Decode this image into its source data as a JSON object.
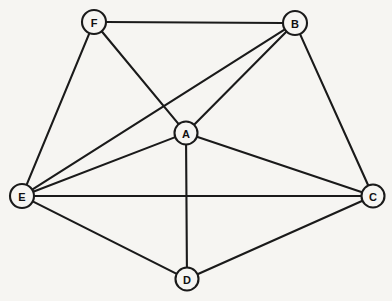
{
  "figure": {
    "background_color": "#f6f5f2",
    "stroke_color": "#1a1a1a",
    "width": 392,
    "height": 301
  },
  "graph": {
    "type": "undirected-node-link-diagram",
    "node_radius": 11.5,
    "vertex_count": 6,
    "edge_count": 12,
    "nodes": [
      {
        "id": "A",
        "label": "A",
        "x": 186,
        "y": 133,
        "r": 11.5
      },
      {
        "id": "B",
        "label": "B",
        "x": 295,
        "y": 23,
        "r": 12.0
      },
      {
        "id": "C",
        "label": "C",
        "x": 373,
        "y": 196,
        "r": 11.5
      },
      {
        "id": "D",
        "label": "D",
        "x": 187,
        "y": 279,
        "r": 11.5
      },
      {
        "id": "E",
        "label": "E",
        "x": 22,
        "y": 196,
        "r": 12.0
      },
      {
        "id": "F",
        "label": "F",
        "x": 94,
        "y": 22,
        "r": 12.0
      }
    ],
    "edges": [
      {
        "id": "edge-F-B",
        "source": "F",
        "target": "B"
      },
      {
        "id": "edge-F-E",
        "source": "F",
        "target": "E"
      },
      {
        "id": "edge-F-A",
        "source": "F",
        "target": "A"
      },
      {
        "id": "edge-B-A",
        "source": "B",
        "target": "A"
      },
      {
        "id": "edge-B-E",
        "source": "B",
        "target": "E"
      },
      {
        "id": "edge-B-C",
        "source": "B",
        "target": "C"
      },
      {
        "id": "edge-A-E",
        "source": "A",
        "target": "E"
      },
      {
        "id": "edge-A-C",
        "source": "A",
        "target": "C"
      },
      {
        "id": "edge-A-D",
        "source": "A",
        "target": "D"
      },
      {
        "id": "edge-E-C",
        "source": "E",
        "target": "C"
      },
      {
        "id": "edge-E-D",
        "source": "E",
        "target": "D"
      },
      {
        "id": "edge-C-D",
        "source": "C",
        "target": "D"
      }
    ]
  }
}
